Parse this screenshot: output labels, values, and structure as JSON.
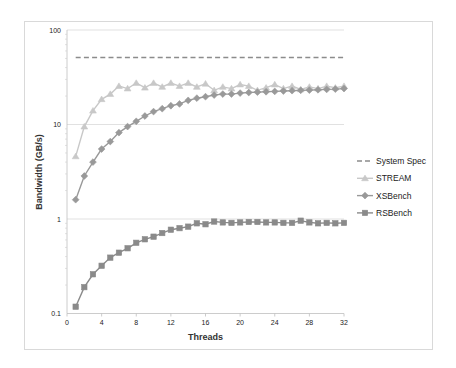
{
  "chart_data": {
    "type": "line",
    "title": "",
    "xlabel": "Threads",
    "ylabel": "Bandwidth (GB/s)",
    "yscale": "log",
    "xlim": [
      0,
      32
    ],
    "ylim": [
      0.1,
      100
    ],
    "x_ticks": [
      "0",
      "4",
      "8",
      "12",
      "16",
      "20",
      "24",
      "28",
      "32"
    ],
    "y_ticks": [
      "0.1",
      "1",
      "10",
      "100"
    ],
    "grid": "horizontal major gridlines",
    "legend_position": "right",
    "x": [
      1,
      2,
      3,
      4,
      5,
      6,
      7,
      8,
      9,
      10,
      11,
      12,
      13,
      14,
      15,
      16,
      17,
      18,
      19,
      20,
      21,
      22,
      23,
      24,
      25,
      26,
      27,
      28,
      29,
      30,
      31,
      32
    ],
    "series": [
      {
        "name": "System Spec",
        "style": "dashed",
        "marker": "none",
        "color": "#8c8c8c",
        "values": [
          51.2,
          51.2,
          51.2,
          51.2,
          51.2,
          51.2,
          51.2,
          51.2,
          51.2,
          51.2,
          51.2,
          51.2,
          51.2,
          51.2,
          51.2,
          51.2,
          51.2,
          51.2,
          51.2,
          51.2,
          51.2,
          51.2,
          51.2,
          51.2,
          51.2,
          51.2,
          51.2,
          51.2,
          51.2,
          51.2,
          51.2,
          51.2
        ]
      },
      {
        "name": "STREAM",
        "style": "solid",
        "marker": "triangle",
        "color": "#c8c8c8",
        "values": [
          4.6,
          9.5,
          14.0,
          18.5,
          21.0,
          25.5,
          24.0,
          27.5,
          24.5,
          27.5,
          25.0,
          27.5,
          25.5,
          27.5,
          25.0,
          27.0,
          23.0,
          25.0,
          24.0,
          26.5,
          25.5,
          23.0,
          24.5,
          26.5,
          24.0,
          25.5,
          23.5,
          25.0,
          24.0,
          25.5,
          24.5,
          25.5
        ]
      },
      {
        "name": "XSBench",
        "style": "solid",
        "marker": "diamond",
        "color": "#999999",
        "values": [
          1.6,
          2.85,
          4.0,
          5.5,
          6.6,
          8.2,
          9.5,
          10.8,
          12.3,
          13.7,
          14.7,
          15.8,
          16.5,
          18.0,
          19.0,
          19.7,
          20.5,
          21.0,
          21.0,
          21.5,
          21.8,
          22.0,
          22.2,
          22.4,
          22.6,
          22.8,
          23.0,
          23.1,
          23.3,
          23.5,
          23.7,
          24.0
        ]
      },
      {
        "name": "RSBench",
        "style": "solid",
        "marker": "square",
        "color": "#8a8a8a",
        "values": [
          0.118,
          0.19,
          0.26,
          0.32,
          0.39,
          0.44,
          0.49,
          0.56,
          0.61,
          0.65,
          0.71,
          0.77,
          0.8,
          0.83,
          0.9,
          0.88,
          0.94,
          0.92,
          0.91,
          0.92,
          0.93,
          0.93,
          0.92,
          0.92,
          0.91,
          0.91,
          0.96,
          0.92,
          0.9,
          0.91,
          0.9,
          0.91
        ]
      }
    ]
  }
}
